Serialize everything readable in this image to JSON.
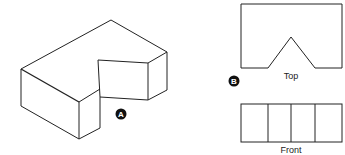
{
  "figure_a": {
    "label": "A"
  },
  "figure_b": {
    "label": "B",
    "top_view_label": "Top",
    "front_view_label": "Front"
  },
  "colors": {
    "line": "#222222",
    "background": "#ffffff"
  }
}
